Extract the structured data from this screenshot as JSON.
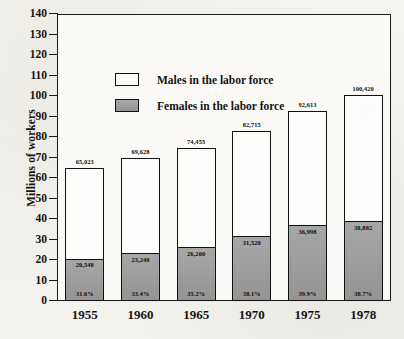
{
  "chart_data": {
    "type": "bar",
    "subtype": "stacked-vertical",
    "title": "",
    "xlabel": "",
    "ylabel": "Millions of workers",
    "ylim": [
      0,
      140
    ],
    "ytick_step": 10,
    "yticks": [
      "140",
      "130",
      "120",
      "110",
      "100",
      "90",
      "80",
      "70",
      "60",
      "50",
      "40",
      "30",
      "20",
      "10",
      "0"
    ],
    "grid": false,
    "legend_position": "upper-left-inside",
    "categories": [
      "1955",
      "1960",
      "1965",
      "1970",
      "1975",
      "1978"
    ],
    "series": [
      {
        "name": "Females in the labor force",
        "color": "#9d9d9d",
        "values": [
          20548,
          23240,
          26200,
          31520,
          36998,
          38882
        ],
        "labels": [
          "20,548",
          "23,240",
          "26,200",
          "31,520",
          "36,998",
          "38,882"
        ]
      },
      {
        "name": "Males in the labor force",
        "color": "#fdfdfb",
        "values": [
          44475,
          46388,
          48255,
          51195,
          55615,
          61538
        ]
      }
    ],
    "totals": [
      65023,
      69628,
      74455,
      82715,
      92613,
      100420
    ],
    "total_labels": [
      "65,023",
      "69,628",
      "74,455",
      "82,715",
      "92,613",
      "100,420"
    ],
    "female_share_labels": [
      "31.6%",
      "33.4%",
      "35.2%",
      "38.1%",
      "39.9%",
      "38.7%"
    ],
    "units_note": "values in thousands of workers; axis in millions"
  },
  "legend": {
    "items": [
      {
        "label": "Males in the labor force",
        "swatch": "white"
      },
      {
        "label": "Females in the labor force",
        "swatch": "gray"
      }
    ]
  },
  "colors": {
    "female_fill": "#9d9d9d",
    "male_fill": "#fdfdfb",
    "outline": "#111111",
    "paper": "#f3f1ec"
  }
}
